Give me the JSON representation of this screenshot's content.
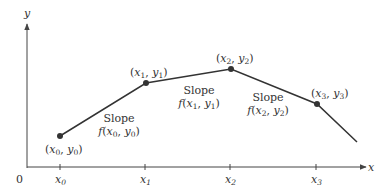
{
  "diagram": {
    "axes": {
      "x_label": "x",
      "y_label": "y",
      "origin_label": "0",
      "color": "#444444"
    },
    "ticks": [
      {
        "base": "x",
        "sub": "0",
        "px": 60
      },
      {
        "base": "x",
        "sub": "1",
        "px": 145
      },
      {
        "base": "x",
        "sub": "2",
        "px": 230
      },
      {
        "base": "x",
        "sub": "3",
        "px": 316
      }
    ],
    "points": [
      {
        "label_x": "x",
        "label_y": "y",
        "sub": "0",
        "px": 60,
        "py": 136
      },
      {
        "label_x": "x",
        "label_y": "y",
        "sub": "1",
        "px": 146,
        "py": 83
      },
      {
        "label_x": "x",
        "label_y": "y",
        "sub": "2",
        "px": 231,
        "py": 69
      },
      {
        "label_x": "x",
        "label_y": "y",
        "sub": "3",
        "px": 317,
        "py": 104
      }
    ],
    "segment_end": {
      "px": 357,
      "py": 142
    },
    "slopes": [
      {
        "title": "Slope",
        "func": "f",
        "sub": "0"
      },
      {
        "title": "Slope",
        "func": "f",
        "sub": "1"
      },
      {
        "title": "Slope",
        "func": "f",
        "sub": "2"
      }
    ],
    "line_color": "#333333",
    "point_color": "#333333"
  }
}
